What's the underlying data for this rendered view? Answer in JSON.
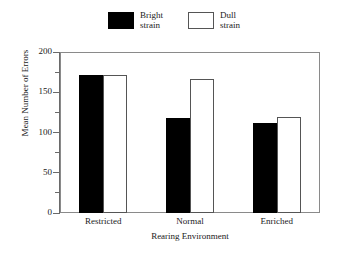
{
  "chart_data": {
    "type": "bar",
    "title": "",
    "xlabel": "Rearing Environment",
    "ylabel": "Mean Number of Errors",
    "categories": [
      "Restricted",
      "Normal",
      "Enriched"
    ],
    "series": [
      {
        "name": "Bright strain",
        "values": [
          172,
          118,
          112
        ],
        "fill": "#000000"
      },
      {
        "name": "Dull strain",
        "values": [
          172,
          166,
          119
        ],
        "fill": "#ffffff"
      }
    ],
    "ylim": [
      0,
      200
    ],
    "ytick_labels": [
      "0",
      "50",
      "100",
      "150",
      "200"
    ],
    "ytick_values": [
      0,
      50,
      100,
      150,
      200
    ],
    "yminor_values": [
      25,
      75,
      125,
      175
    ],
    "grid": false,
    "legend_position": "above-plot"
  },
  "legend": {
    "entries": [
      {
        "line1": "Bright",
        "line2": "strain",
        "swatch": "filled-black-square"
      },
      {
        "line1": "Dull",
        "line2": "strain",
        "swatch": "hollow-white-square"
      }
    ]
  },
  "colors": {
    "background": "#ffffff",
    "axis": "#6a6a6a",
    "frame": "#8a8a8a",
    "bright_bar": "#000000",
    "dull_bar": "#ffffff",
    "dull_bar_edge": "#555555",
    "text": "#1a1a1a"
  }
}
